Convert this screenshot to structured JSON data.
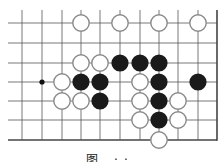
{
  "diagram": {
    "type": "go-board-fragment",
    "grid": {
      "columns_x": [
        22,
        42,
        62,
        81,
        100,
        120,
        140,
        159,
        178,
        198
      ],
      "rows_y": [
        23,
        43,
        63,
        82,
        101,
        120,
        140
      ],
      "right_edge_x": 217,
      "bottom_edge_y": 140,
      "line_color": "#555555",
      "edge_color": "#444444"
    },
    "star_points": [
      {
        "col": 1,
        "row": 3
      }
    ],
    "stones": [
      {
        "color": "white",
        "col": 3,
        "row": 0
      },
      {
        "color": "white",
        "col": 5,
        "row": 0
      },
      {
        "color": "white",
        "col": 7,
        "row": 0
      },
      {
        "color": "white",
        "col": 9,
        "row": 0
      },
      {
        "color": "white",
        "col": 3,
        "row": 2
      },
      {
        "color": "white",
        "col": 4,
        "row": 2
      },
      {
        "color": "black",
        "col": 5,
        "row": 2
      },
      {
        "color": "black",
        "col": 6,
        "row": 2
      },
      {
        "color": "black",
        "col": 7,
        "row": 2
      },
      {
        "color": "white",
        "col": 2,
        "row": 3
      },
      {
        "color": "black",
        "col": 3,
        "row": 3
      },
      {
        "color": "black",
        "col": 4,
        "row": 3
      },
      {
        "color": "white",
        "col": 6,
        "row": 3
      },
      {
        "color": "black",
        "col": 7,
        "row": 3
      },
      {
        "color": "black",
        "col": 9,
        "row": 3
      },
      {
        "color": "white",
        "col": 2,
        "row": 4
      },
      {
        "color": "white",
        "col": 3,
        "row": 4
      },
      {
        "color": "black",
        "col": 4,
        "row": 4
      },
      {
        "color": "white",
        "col": 6,
        "row": 4
      },
      {
        "color": "black",
        "col": 7,
        "row": 4
      },
      {
        "color": "white",
        "col": 8,
        "row": 4
      },
      {
        "color": "white",
        "col": 6,
        "row": 5
      },
      {
        "color": "black",
        "col": 7,
        "row": 5
      },
      {
        "color": "white",
        "col": 8,
        "row": 5
      },
      {
        "color": "white",
        "col": 7,
        "row": 6
      }
    ],
    "colors": {
      "black_stone": "#1a1a1a",
      "white_stone_fill": "#ffffff",
      "white_stone_stroke": "#8a8a8a"
    }
  },
  "caption": {
    "text": "图 ··"
  }
}
